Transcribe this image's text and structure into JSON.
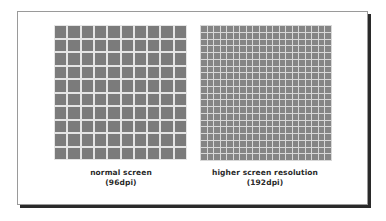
{
  "diagram": {
    "left_panel": {
      "grid_rows": 10,
      "grid_cols": 10,
      "label_line1": "normal screen",
      "label_line2": "(96dpi)"
    },
    "right_panel": {
      "grid_rows": 20,
      "grid_cols": 20,
      "label_line1": "higher screen resolution",
      "label_line2": "(192dpi)"
    },
    "colors": {
      "cell": "#7b7b7b",
      "gap": "#e4e4e4",
      "frame_shadow": "#2a2a2a",
      "text": "#2a2a2a"
    }
  }
}
